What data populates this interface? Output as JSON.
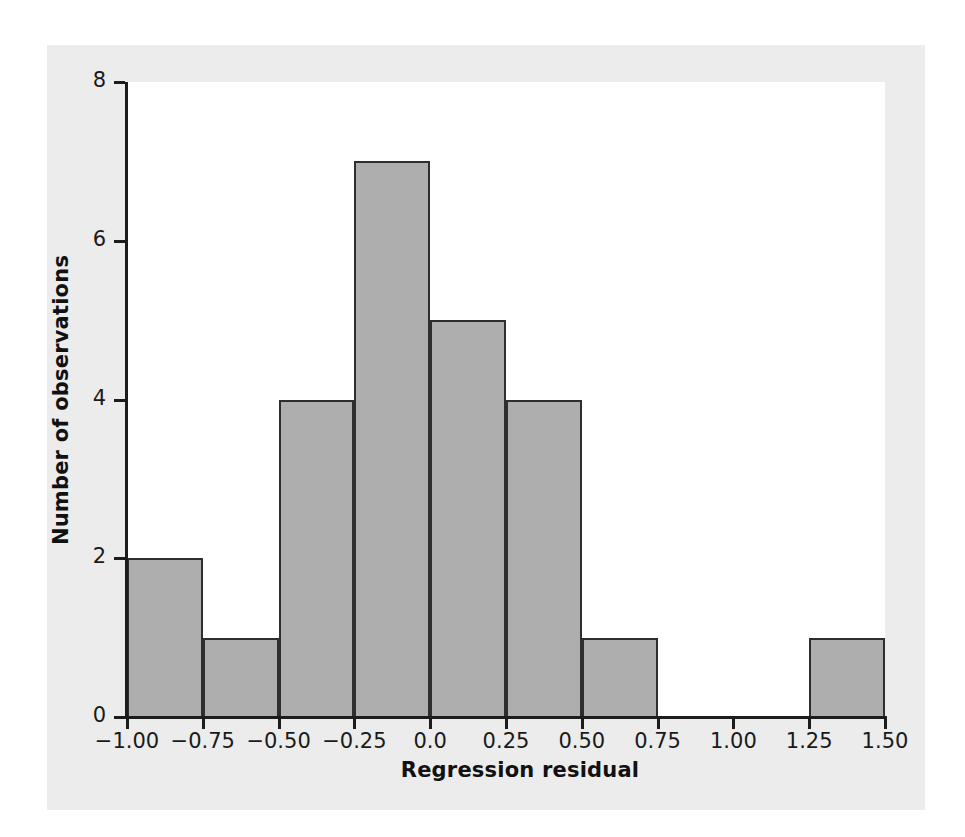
{
  "chart_data": {
    "type": "bar",
    "title": "",
    "subtitle": "",
    "xlabel": "Regression residual",
    "ylabel": "Number of observations",
    "xlim": [
      -1.0,
      1.5
    ],
    "ylim": [
      0,
      8
    ],
    "bin_width": 0.25,
    "grid": false,
    "legend": null,
    "x_tick_labels": [
      "−1.00",
      "−0.75",
      "−0.50",
      "−0.25",
      "0.0",
      "0.25",
      "0.50",
      "0.75",
      "1.00",
      "1.25",
      "1.50"
    ],
    "x_tick_values": [
      -1.0,
      -0.75,
      -0.5,
      -0.25,
      0.0,
      0.25,
      0.5,
      0.75,
      1.0,
      1.25,
      1.5
    ],
    "y_tick_labels": [
      "0",
      "2",
      "4",
      "6",
      "8"
    ],
    "y_tick_values": [
      0,
      2,
      4,
      6,
      8
    ],
    "categories": [
      "−1.00 to −0.75",
      "−0.75 to −0.50",
      "−0.50 to −0.25",
      "−0.25 to 0.00",
      "0.00 to 0.25",
      "0.25 to 0.50",
      "0.50 to 0.75",
      "0.75 to 1.00",
      "1.00 to 1.25",
      "1.25 to 1.50"
    ],
    "values": [
      2,
      1,
      4,
      7,
      5,
      4,
      1,
      0,
      0,
      1
    ],
    "bins": [
      {
        "x0": -1.0,
        "x1": -0.75,
        "count": 2
      },
      {
        "x0": -0.75,
        "x1": -0.5,
        "count": 1
      },
      {
        "x0": -0.5,
        "x1": -0.25,
        "count": 4
      },
      {
        "x0": -0.25,
        "x1": 0.0,
        "count": 7
      },
      {
        "x0": 0.0,
        "x1": 0.25,
        "count": 5
      },
      {
        "x0": 0.25,
        "x1": 0.5,
        "count": 4
      },
      {
        "x0": 0.5,
        "x1": 0.75,
        "count": 1
      },
      {
        "x0": 0.75,
        "x1": 1.0,
        "count": 0
      },
      {
        "x0": 1.0,
        "x1": 1.25,
        "count": 0
      },
      {
        "x0": 1.25,
        "x1": 1.5,
        "count": 1
      }
    ],
    "total_observations": 25,
    "colors": {
      "bar_fill": "#aeaeae",
      "bar_stroke": "#2e2e2e",
      "axis": "#1c1c1c",
      "plot_background": "#ffffff",
      "page_background": "#ececec",
      "text": "#111111"
    }
  }
}
